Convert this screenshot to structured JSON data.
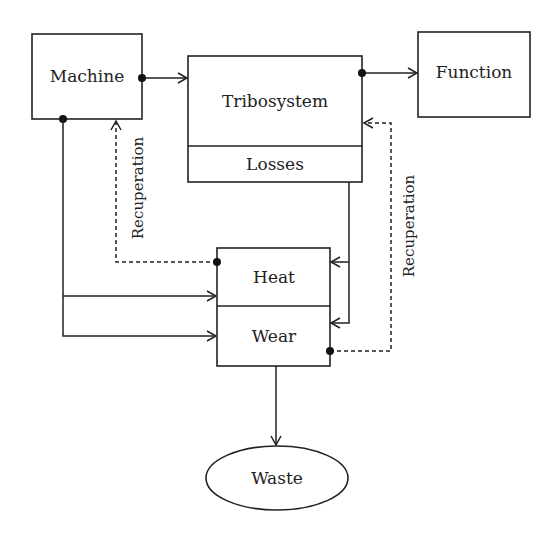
{
  "diagram": {
    "nodes": {
      "machine": {
        "label": "Machine"
      },
      "tribosystem": {
        "label": "Tribosystem",
        "sub_label": "Losses"
      },
      "function": {
        "label": "Function"
      },
      "heat_wear": {
        "top_label": "Heat",
        "bottom_label": "Wear"
      },
      "waste": {
        "label": "Waste"
      }
    },
    "edge_labels": {
      "recuperation_left": "Recuperation",
      "recuperation_right": "Recuperation"
    },
    "edges": [
      {
        "from": "Machine",
        "to": "Tribosystem",
        "style": "solid"
      },
      {
        "from": "Tribosystem",
        "to": "Function",
        "style": "solid"
      },
      {
        "from": "Machine",
        "to": "Heat",
        "style": "solid"
      },
      {
        "from": "Machine",
        "to": "Wear",
        "style": "solid"
      },
      {
        "from": "Losses",
        "to": "Heat",
        "style": "solid"
      },
      {
        "from": "Losses",
        "to": "Wear",
        "style": "solid"
      },
      {
        "from": "Heat",
        "to": "Machine",
        "style": "dashed",
        "label": "Recuperation"
      },
      {
        "from": "Wear",
        "to": "Tribosystem",
        "style": "dashed",
        "label": "Recuperation"
      },
      {
        "from": "Wear",
        "to": "Waste",
        "style": "solid"
      }
    ]
  }
}
